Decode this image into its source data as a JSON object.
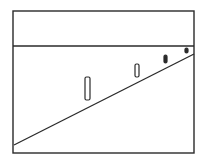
{
  "diagram": {
    "type": "perspective-drawing",
    "stroke_color": "#2a2a2a",
    "background": "#ffffff",
    "frame": {
      "x": 13,
      "y": 11,
      "width": 181,
      "height": 142
    },
    "horizon": {
      "x1": 13,
      "y1": 46,
      "x2": 194,
      "y2": 46
    },
    "ground_line": {
      "x1": 14,
      "y1": 145,
      "x2": 194,
      "y2": 54
    },
    "posts": [
      {
        "x": 85,
        "y": 77,
        "width": 5,
        "height": 23
      },
      {
        "x": 135,
        "y": 64,
        "width": 4,
        "height": 13
      },
      {
        "x": 164,
        "y": 55,
        "width": 3,
        "height": 8
      },
      {
        "x": 185,
        "y": 48,
        "width": 3,
        "height": 5
      }
    ]
  }
}
